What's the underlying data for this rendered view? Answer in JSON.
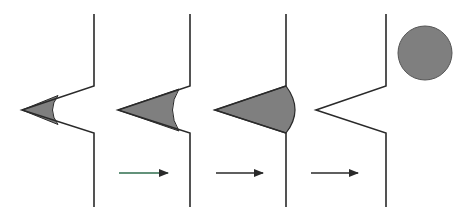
{
  "diagram": {
    "colors": {
      "line": "#2a2a2a",
      "fill": "#7f7f7f",
      "arrow_first": "#2f6e4e",
      "arrow": "#2a2a2a",
      "background": "#ffffff"
    },
    "panels": [
      {
        "id": 1,
        "wall_x": 94,
        "tip_x": 22,
        "front": "concave",
        "front_x": 55
      },
      {
        "id": 2,
        "wall_x": 190,
        "tip_x": 118,
        "front": "concave",
        "front_x": 175
      },
      {
        "id": 3,
        "wall_x": 286,
        "tip_x": 215,
        "front": "convex",
        "front_x": 295
      },
      {
        "id": 4,
        "wall_x": 386,
        "tip_x": 316,
        "front": "none"
      }
    ],
    "arrows": [
      {
        "from_x": 119,
        "to_x": 168,
        "y": 173
      },
      {
        "from_x": 216,
        "to_x": 263,
        "y": 173
      },
      {
        "from_x": 311,
        "to_x": 358,
        "y": 173
      }
    ],
    "droplet": {
      "cx": 425,
      "cy": 53,
      "r": 27
    }
  }
}
